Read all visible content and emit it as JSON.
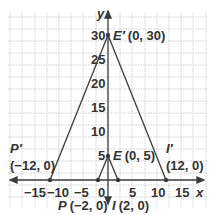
{
  "diagram": {
    "type": "coordinate-plane-dilation",
    "axes": {
      "x_label": "x",
      "y_label": "y",
      "x_ticks": [
        "−15",
        "−10",
        "−5",
        "0",
        "5",
        "10",
        "15"
      ],
      "y_ticks": [
        "5",
        "10",
        "15",
        "20",
        "25",
        "30"
      ]
    },
    "points": {
      "E_prime": {
        "name": "E′",
        "coords": "(0, 30)"
      },
      "E": {
        "name": "E",
        "coords": "(0, 5)"
      },
      "P_prime": {
        "name": "P′",
        "coords": "(−12, 0)"
      },
      "I_prime": {
        "name": "I′",
        "coords": "(12, 0)"
      },
      "P": {
        "name": "P",
        "coords": "(−2, 0)"
      },
      "I": {
        "name": "I",
        "coords": "(2, 0)"
      }
    },
    "colors": {
      "grid": "#c8c8c8",
      "axis": "#3a3a3a",
      "line": "#3a3a3a",
      "text": "#333333"
    }
  }
}
